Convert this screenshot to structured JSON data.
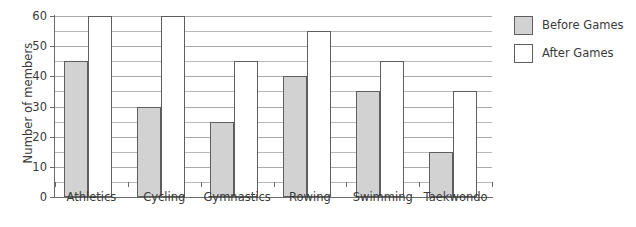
{
  "chart_data": {
    "type": "bar",
    "title": "",
    "subtitle": "",
    "xlabel": "",
    "ylabel": "Number of members",
    "categories": [
      "Athletics",
      "Cycling",
      "Gymnastics",
      "Rowing",
      "Swimming",
      "Taekwondo"
    ],
    "series": [
      {
        "name": "Before Games",
        "color": "#d2d2d2",
        "values": [
          45,
          30,
          25,
          40,
          35,
          15
        ]
      },
      {
        "name": "After Games",
        "color": "#ffffff",
        "values": [
          60,
          60,
          45,
          55,
          45,
          35
        ]
      }
    ],
    "ylim": [
      0,
      60
    ],
    "ytick_step": 10,
    "yticks": [
      0,
      10,
      20,
      30,
      40,
      50,
      60
    ],
    "ytick_labels": [
      "0",
      "10",
      "20",
      "30",
      "40",
      "50",
      "60"
    ],
    "minor_gridline_step": 5,
    "minor_gridlines": [
      5,
      15,
      25,
      35,
      45,
      55
    ],
    "grid": true,
    "legend_position": "right",
    "bar_border_color": "#5e5e5e",
    "gridline_color": "#b9b9b9",
    "axis_color": "#6b6b6b",
    "text_color": "#3a3a3a",
    "background": "#ffffff"
  },
  "legend": {
    "entries": [
      {
        "label": "Before Games",
        "swatch": "before"
      },
      {
        "label": "After Games",
        "swatch": "after"
      }
    ]
  }
}
